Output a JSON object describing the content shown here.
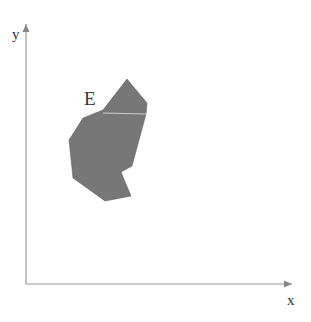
{
  "diagram": {
    "axes": {
      "x_label": "x",
      "y_label": "y",
      "origin": [
        26,
        284
      ],
      "x_end": [
        292,
        284
      ],
      "y_end": [
        26,
        24
      ],
      "color": "#999999"
    },
    "region": {
      "label": "E",
      "fill": "#777777",
      "points": [
        [
          127,
          79
        ],
        [
          147,
          103
        ],
        [
          146,
          114
        ],
        [
          132,
          166
        ],
        [
          121,
          172
        ],
        [
          131,
          196
        ],
        [
          105,
          201
        ],
        [
          73,
          178
        ],
        [
          69,
          140
        ],
        [
          83,
          118
        ],
        [
          103,
          110
        ]
      ],
      "inner_line": [
        [
          103,
          113
        ],
        [
          146,
          114
        ]
      ]
    }
  }
}
